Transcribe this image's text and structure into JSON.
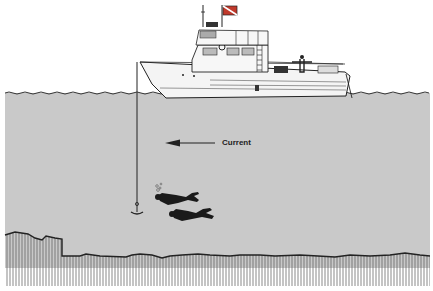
{
  "diagram": {
    "type": "illustration",
    "labels": {
      "current": "Current"
    },
    "colors": {
      "water": "#c9c9c9",
      "sky": "#ffffff",
      "line": "#222222",
      "boat": "#f4f4f4",
      "flag_red": "#c0392b"
    },
    "elements": [
      {
        "name": "dive-boat",
        "description": "motor dive boat at surface"
      },
      {
        "name": "dive-flag",
        "description": "diver-down flag on boat mast"
      },
      {
        "name": "anchor-line",
        "description": "vertical line from bow to anchor"
      },
      {
        "name": "anchor",
        "description": "anchor at bottom of line"
      },
      {
        "name": "current-arrow",
        "description": "arrow pointing left, labelled Current"
      },
      {
        "name": "diver-1",
        "description": "upper diver with bubbles"
      },
      {
        "name": "diver-2",
        "description": "lower diver"
      },
      {
        "name": "seabed",
        "description": "rocky sea floor with vertical hatching"
      }
    ]
  }
}
